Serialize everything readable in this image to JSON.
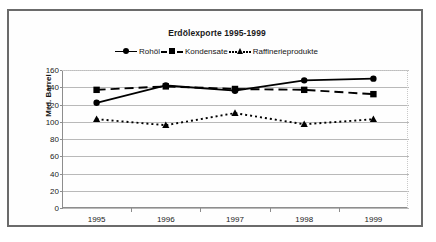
{
  "chart_data": {
    "type": "line",
    "title": "Erdölexporte 1995-1999",
    "xlabel": "",
    "ylabel": "Mrd. Barrel",
    "categories": [
      "1995",
      "1996",
      "1997",
      "1998",
      "1999"
    ],
    "ylim": [
      0,
      160
    ],
    "yticks": [
      "0",
      "20",
      "40",
      "60",
      "80",
      "100",
      "120",
      "140",
      "160"
    ],
    "grid": "horizontal",
    "legend_position": "top-center",
    "series": [
      {
        "name": "Rohöl",
        "marker": "circle",
        "line": "solid",
        "values": [
          122,
          142,
          136,
          148,
          150
        ]
      },
      {
        "name": "Kondensate",
        "marker": "square",
        "line": "dashed",
        "values": [
          137,
          141,
          138,
          137,
          132
        ]
      },
      {
        "name": "Raffinerieprodukte",
        "marker": "triangle",
        "line": "dotted",
        "values": [
          103,
          96,
          110,
          97,
          103
        ]
      }
    ],
    "colors": {
      "series": "#000000",
      "grid": "#b9b9b9",
      "axis": "#8d8d8d",
      "frame": "#6b6b6b",
      "text": "#1a1a1a",
      "background": "#ffffff"
    }
  }
}
